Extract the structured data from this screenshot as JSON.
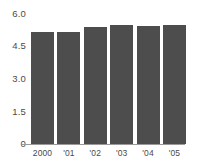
{
  "chart_data": {
    "type": "bar",
    "title": "",
    "subtitle": "",
    "xlabel": "",
    "ylabel": "",
    "categories": [
      "2000",
      "'01",
      "'02",
      "'03",
      "'04",
      "'05"
    ],
    "values": [
      4.93,
      4.96,
      5.16,
      5.23,
      5.21,
      5.25
    ],
    "series": [
      {
        "name": "",
        "values": [
          4.93,
          4.96,
          5.16,
          5.23,
          5.21,
          5.25
        ]
      }
    ],
    "ylim": [
      0,
      6.0
    ],
    "xlim": null,
    "ytick_labels": [
      "6.0",
      "4.5",
      "3.0",
      "1.5",
      "0"
    ],
    "ytick_values": [
      6.0,
      4.5,
      3.0,
      1.5,
      0
    ],
    "xtick_labels": [
      "2000",
      "'01",
      "'02",
      "'03",
      "'04",
      "'05"
    ],
    "grid": false,
    "legend": null,
    "legend_position": "none",
    "annotations": [],
    "colors": {
      "bar": "#4d4d4d",
      "axis": "#9a9a9a",
      "tick_label": "#4a4a4a",
      "background": "#ffffff"
    }
  }
}
